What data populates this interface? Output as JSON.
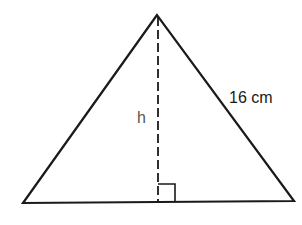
{
  "diagram": {
    "type": "triangle-with-altitude",
    "labels": {
      "height": "h",
      "side": "16 cm"
    },
    "vertices": {
      "apex": [
        157,
        15
      ],
      "bottom_left": [
        23,
        203
      ],
      "bottom_right": [
        294,
        201
      ]
    },
    "altitude": {
      "from": [
        158,
        17
      ],
      "to": [
        158,
        202
      ],
      "style": "dashed"
    },
    "right_angle_marker": {
      "x": 158,
      "y": 184,
      "size": 17
    },
    "colors": {
      "stroke": "#1a1a1a",
      "background": "#ffffff",
      "height_label": "#555555"
    }
  }
}
